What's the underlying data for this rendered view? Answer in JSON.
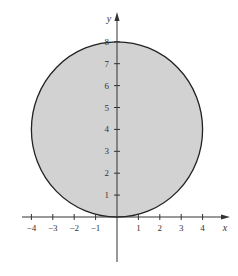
{
  "chart_data": {
    "type": "area",
    "title": "",
    "xlabel": "x",
    "ylabel": "y",
    "xlim": [
      -4.5,
      5
    ],
    "ylim": [
      -2.7,
      8.5
    ],
    "x_ticks": [
      -4,
      -3,
      -2,
      -1,
      1,
      2,
      3,
      4
    ],
    "x_tick_labels": [
      "−4",
      "−3",
      "−2",
      "−1",
      "1",
      "2",
      "3",
      "4"
    ],
    "y_ticks": [
      1,
      2,
      3,
      4,
      5,
      6,
      7,
      8
    ],
    "y_tick_labels": [
      "1",
      "2",
      "3",
      "4",
      "5",
      "6",
      "7",
      "8"
    ],
    "grid": false,
    "legend": null,
    "shapes": [
      {
        "kind": "filled-circle",
        "description": "Shaded disk x^2 + (y-4)^2 <= 16",
        "center": [
          0,
          4
        ],
        "radius": 4,
        "fill": "#d2d2d2",
        "stroke": "#222222"
      }
    ]
  },
  "colors": {
    "fill": "#d2d2d2",
    "stroke": "#222222",
    "axis": "#333333"
  }
}
